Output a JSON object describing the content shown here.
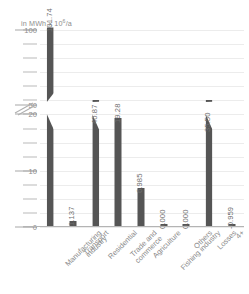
{
  "chart_data": {
    "type": "bar",
    "title": "",
    "subtitle": "",
    "xlabel": "",
    "ylabel": "in MWh x 10⁶/a",
    "ylabel_prefix": "in MWh x 10",
    "ylabel_exponent": "6",
    "ylabel_suffix": "/a",
    "categories": [
      "Manufacturing industry",
      "Transport",
      "Residential",
      "Trade and commerce",
      "Agriculture",
      "Fishing industry",
      "Others",
      "Losses",
      "4+"
    ],
    "category_lines": [
      [
        "Manufacturing",
        "industry"
      ],
      [
        "Transport"
      ],
      [
        "Residential"
      ],
      [
        "Trade and",
        "commerce"
      ],
      [
        "Agriculture"
      ],
      [
        "Fishing industry"
      ],
      [
        "Others"
      ],
      [
        "Losses"
      ],
      [
        "4+"
      ]
    ],
    "values": [
      101.74,
      1.137,
      40.87,
      19.28,
      6.985,
      0.0,
      0.0,
      35.5,
      -0.959
    ],
    "value_labels": [
      "101.74",
      "1.137",
      "40.87",
      "19.28",
      "6.985",
      "0.000",
      "0.000",
      "35.50",
      "-0.959"
    ],
    "ytick_labels": [
      "100",
      "50",
      "20",
      "10",
      "0"
    ],
    "ytick_values": [
      100,
      50,
      20,
      10,
      0
    ],
    "yminor_count": 14,
    "ylim": [
      0,
      100
    ],
    "axis_break": true,
    "axis_break_between": [
      20,
      50
    ],
    "grid": true,
    "legend": "none",
    "bar_color": "#555555",
    "grid_color": "#ececec",
    "text_color": "#8a8a8a",
    "axis_color": "#b4b4b4"
  }
}
